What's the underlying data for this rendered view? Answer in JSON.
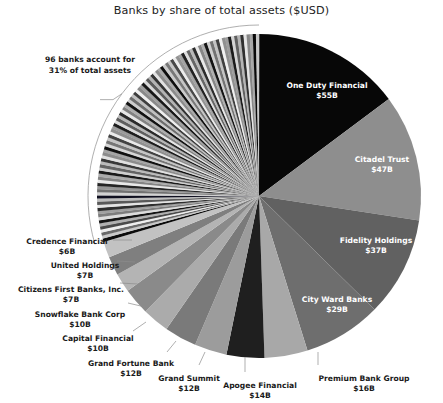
{
  "chart_data": {
    "type": "pie",
    "title": "Banks by share of total assets ($USD)",
    "unit": "$USD billions",
    "value_total": 355,
    "start_angle_deg": 0,
    "direction": "clockwise",
    "legend": "none",
    "grid": false,
    "categories": [
      "One Duty Financial",
      "Citadel Trust",
      "Fidelity Holdings",
      "City Ward Banks",
      "Premium Bank Group",
      "Apogee Financial",
      "Grand Summit",
      "Grand Fortune Bank",
      "Capital Financial",
      "Snowflake Bank Corp",
      "Citizens First Banks, Inc.",
      "United Holdings",
      "Credence Financial",
      "96 other banks"
    ],
    "values": [
      55,
      47,
      37,
      29,
      16,
      14,
      12,
      12,
      10,
      10,
      7,
      7,
      6,
      110
    ],
    "slices": [
      {
        "name": "One Duty Financial",
        "value": 55,
        "value_label": "$55B",
        "color": "#070707",
        "label_placement": "inside"
      },
      {
        "name": "Citadel Trust",
        "value": 47,
        "value_label": "$47B",
        "color": "#8e8e8e",
        "label_placement": "inside"
      },
      {
        "name": "Fidelity Holdings",
        "value": 37,
        "value_label": "$37B",
        "color": "#616161",
        "label_placement": "inside"
      },
      {
        "name": "City Ward Banks",
        "value": 29,
        "value_label": "$29B",
        "color": "#6e6e6e",
        "label_placement": "inside"
      },
      {
        "name": "Premium Bank Group",
        "value": 16,
        "value_label": "$16B",
        "color": "#a8a8a8",
        "label_placement": "outside"
      },
      {
        "name": "Apogee Financial",
        "value": 14,
        "value_label": "$14B",
        "color": "#1f1f1f",
        "label_placement": "outside"
      },
      {
        "name": "Grand Summit",
        "value": 12,
        "value_label": "$12B",
        "color": "#9c9c9c",
        "label_placement": "outside"
      },
      {
        "name": "Grand Fortune Bank",
        "value": 12,
        "value_label": "$12B",
        "color": "#7a7a7a",
        "label_placement": "outside"
      },
      {
        "name": "Capital Financial",
        "value": 10,
        "value_label": "$10B",
        "color": "#ababab",
        "label_placement": "outside"
      },
      {
        "name": "Snowflake Bank Corp",
        "value": 10,
        "value_label": "$10B",
        "color": "#8a8a8a",
        "label_placement": "outside"
      },
      {
        "name": "Citizens First Banks, Inc.",
        "value": 7,
        "value_label": "$7B",
        "color": "#b4b4b4",
        "label_placement": "outside"
      },
      {
        "name": "United Holdings",
        "value": 7,
        "value_label": "$7B",
        "color": "#7f7f7f",
        "label_placement": "outside"
      },
      {
        "name": "Credence Financial",
        "value": 6,
        "value_label": "$6B",
        "color": "#c2c2c2",
        "label_placement": "outside"
      }
    ],
    "grouped_slice": {
      "count": 96,
      "share_percent": 31,
      "callout_line_1": "96 banks account for",
      "callout_line_2": "31% of total assets",
      "thin_slice_colors": [
        "#0b0b0b",
        "#c9c9c9",
        "#6a6a6a",
        "#ededed",
        "#4a4a4a",
        "#b0b0b0",
        "#141414",
        "#dcdcdc",
        "#7d7d7d",
        "#a0a0a0",
        "#2e2e2e",
        "#e4e4e4",
        "#595959",
        "#bdbdbd",
        "#0f0f1f",
        "#d2d2d2",
        "#717171",
        "#969696",
        "#252525",
        "#e8e8e8",
        "#848484",
        "#ababab",
        "#1a1a1a",
        "#cfcfcf",
        "#646464",
        "#bababa",
        "#383838",
        "#e0e0e0",
        "#8c8c8c",
        "#a5a5a5",
        "#101010",
        "#d6d6d6",
        "#767676",
        "#c4c4c4",
        "#434343",
        "#eaeaea",
        "#8f8f8f",
        "#9b9b9b",
        "#1d1d1d",
        "#dadada",
        "#5e5e5e",
        "#b7b7b7",
        "#2a2a2a",
        "#e6e6e6",
        "#818181",
        "#aeaeae",
        "#121212",
        "#cdcdcd",
        "#6d6d6d",
        "#c0c0c0",
        "#3e3e3e",
        "#efefef",
        "#898989",
        "#9f9f9f",
        "#171717",
        "#d8d8d8",
        "#5b5b5b",
        "#b3b3b3",
        "#333333",
        "#e2e2e2",
        "#8b8b8b",
        "#a9a9a9",
        "#0d0d0d",
        "#cbcbcb",
        "#787878",
        "#c6c6c6",
        "#484848",
        "#ececec",
        "#939393",
        "#a3a3a3",
        "#212121",
        "#dedede",
        "#666666",
        "#b9b9b9",
        "#2c2c2c",
        "#e9e9e9",
        "#868686",
        "#afafaf",
        "#151515",
        "#d0d0d0",
        "#737373",
        "#c3c3c3",
        "#404040",
        "#f0f0f0",
        "#909090",
        "#9d9d9d",
        "#1b1b1b",
        "#d4d4d4",
        "#606060",
        "#b5b5b5",
        "#303030",
        "#e5e5e5",
        "#888888",
        "#a7a7a7",
        "#0a0a0a",
        "#c8c8c8"
      ]
    }
  },
  "geometry": {
    "center_x": 259,
    "center_y": 196,
    "radius": 162
  }
}
